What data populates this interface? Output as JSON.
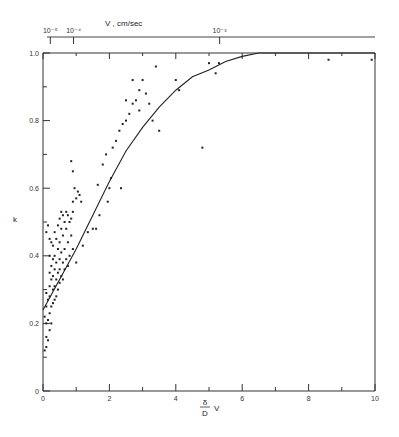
{
  "chart_data": {
    "type": "scatter",
    "title": "",
    "xlabel": "δ/D V",
    "xlabel_numerator": "δ",
    "xlabel_denominator": "D",
    "xlabel_suffix": "V",
    "ylabel": "k",
    "xlim": [
      0,
      10
    ],
    "ylim": [
      0,
      1.0
    ],
    "grid": false,
    "x_ticks": [
      0,
      2,
      4,
      6,
      8,
      10
    ],
    "x_tick_labels": [
      "0",
      "2",
      "4",
      "6",
      "8",
      "10"
    ],
    "y_ticks": [
      0,
      0.2,
      0.4,
      0.6,
      0.8,
      1.0
    ],
    "y_tick_labels": [
      "0",
      "0.2",
      "0.4",
      "0.6",
      "0.8",
      "1.0"
    ],
    "secondary_x_axis": {
      "label": "V , cm/sec",
      "tick_labels": [
        "10⁻⁵",
        "10⁻⁴",
        "10⁻³"
      ],
      "tick_positions": [
        0.1,
        0.8,
        5.2
      ]
    },
    "series": [
      {
        "name": "fitted curve",
        "kind": "line",
        "x": [
          0,
          0.5,
          1.0,
          1.5,
          2.0,
          2.5,
          3.0,
          3.5,
          4.0,
          4.5,
          5.0,
          5.5,
          6.0,
          6.5,
          7,
          8,
          9,
          10
        ],
        "y": [
          0.24,
          0.33,
          0.42,
          0.52,
          0.62,
          0.71,
          0.78,
          0.84,
          0.89,
          0.93,
          0.95,
          0.975,
          0.99,
          1.0,
          1.0,
          1.0,
          1.0,
          1.0
        ]
      },
      {
        "name": "experimental points",
        "kind": "scatter",
        "points": [
          [
            0.05,
            0.12
          ],
          [
            0.1,
            0.13
          ],
          [
            0.1,
            0.16
          ],
          [
            0.15,
            0.15
          ],
          [
            0.2,
            0.18
          ],
          [
            0.1,
            0.2
          ],
          [
            0.15,
            0.21
          ],
          [
            0.25,
            0.2
          ],
          [
            0.05,
            0.22
          ],
          [
            0.2,
            0.23
          ],
          [
            0.1,
            0.25
          ],
          [
            0.25,
            0.25
          ],
          [
            0.3,
            0.26
          ],
          [
            0.15,
            0.27
          ],
          [
            0.35,
            0.27
          ],
          [
            0.2,
            0.28
          ],
          [
            0.4,
            0.28
          ],
          [
            0.1,
            0.29
          ],
          [
            0.3,
            0.3
          ],
          [
            0.45,
            0.3
          ],
          [
            0.2,
            0.31
          ],
          [
            0.35,
            0.31
          ],
          [
            0.5,
            0.32
          ],
          [
            0.25,
            0.33
          ],
          [
            0.4,
            0.33
          ],
          [
            0.6,
            0.33
          ],
          [
            0.3,
            0.34
          ],
          [
            0.45,
            0.35
          ],
          [
            0.55,
            0.34
          ],
          [
            0.2,
            0.35
          ],
          [
            0.35,
            0.36
          ],
          [
            0.5,
            0.36
          ],
          [
            0.65,
            0.36
          ],
          [
            0.25,
            0.37
          ],
          [
            0.4,
            0.38
          ],
          [
            0.6,
            0.38
          ],
          [
            0.75,
            0.37
          ],
          [
            0.3,
            0.39
          ],
          [
            0.5,
            0.39
          ],
          [
            0.7,
            0.39
          ],
          [
            0.2,
            0.4
          ],
          [
            0.35,
            0.4
          ],
          [
            0.55,
            0.41
          ],
          [
            0.8,
            0.4
          ],
          [
            0.45,
            0.42
          ],
          [
            0.65,
            0.42
          ],
          [
            0.9,
            0.42
          ],
          [
            0.3,
            0.43
          ],
          [
            0.5,
            0.44
          ],
          [
            0.75,
            0.44
          ],
          [
            0.4,
            0.45
          ],
          [
            0.6,
            0.46
          ],
          [
            0.85,
            0.46
          ],
          [
            0.35,
            0.47
          ],
          [
            0.55,
            0.48
          ],
          [
            0.7,
            0.48
          ],
          [
            0.45,
            0.49
          ],
          [
            0.65,
            0.5
          ],
          [
            0.8,
            0.5
          ],
          [
            0.5,
            0.51
          ],
          [
            0.6,
            0.52
          ],
          [
            0.75,
            0.52
          ],
          [
            0.55,
            0.53
          ],
          [
            0.7,
            0.53
          ],
          [
            0.85,
            0.51
          ],
          [
            0.9,
            0.53
          ],
          [
            0.1,
            0.47
          ],
          [
            0.15,
            0.49
          ],
          [
            0.2,
            0.45
          ],
          [
            0.25,
            0.44
          ],
          [
            0.9,
            0.56
          ],
          [
            1.0,
            0.57
          ],
          [
            1.05,
            0.59
          ],
          [
            1.1,
            0.58
          ],
          [
            0.95,
            0.6
          ],
          [
            1.15,
            0.56
          ],
          [
            0.85,
            0.68
          ],
          [
            0.9,
            0.65
          ],
          [
            1.0,
            0.38
          ],
          [
            1.2,
            0.43
          ],
          [
            1.35,
            0.47
          ],
          [
            1.5,
            0.48
          ],
          [
            1.6,
            0.48
          ],
          [
            1.7,
            0.52
          ],
          [
            1.95,
            0.56
          ],
          [
            2.0,
            0.6
          ],
          [
            2.05,
            0.63
          ],
          [
            1.65,
            0.61
          ],
          [
            1.8,
            0.67
          ],
          [
            1.9,
            0.7
          ],
          [
            2.1,
            0.72
          ],
          [
            2.2,
            0.74
          ],
          [
            2.3,
            0.77
          ],
          [
            2.35,
            0.6
          ],
          [
            2.4,
            0.79
          ],
          [
            2.5,
            0.8
          ],
          [
            2.6,
            0.82
          ],
          [
            2.7,
            0.85
          ],
          [
            2.8,
            0.86
          ],
          [
            2.9,
            0.89
          ],
          [
            3.0,
            0.92
          ],
          [
            3.1,
            0.88
          ],
          [
            3.2,
            0.85
          ],
          [
            3.3,
            0.8
          ],
          [
            3.4,
            0.96
          ],
          [
            2.5,
            0.86
          ],
          [
            2.7,
            0.92
          ],
          [
            2.9,
            0.83
          ],
          [
            3.5,
            0.77
          ],
          [
            4.0,
            0.92
          ],
          [
            4.1,
            0.89
          ],
          [
            5.0,
            0.97
          ],
          [
            5.2,
            0.94
          ],
          [
            5.3,
            0.97
          ],
          [
            8.6,
            0.98
          ],
          [
            9.9,
            0.98
          ],
          [
            4.8,
            0.72
          ]
        ]
      }
    ]
  }
}
